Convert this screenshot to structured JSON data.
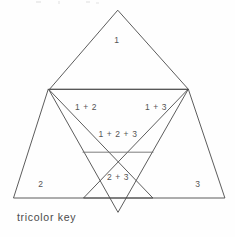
{
  "figure": {
    "caption": "tricolor key",
    "top_fragment": "",
    "regions": [
      {
        "id": "top",
        "label": "1",
        "x": 117,
        "y": 40
      },
      {
        "id": "left",
        "label": "2",
        "x": 41,
        "y": 184
      },
      {
        "id": "right",
        "label": "3",
        "x": 197,
        "y": 184
      },
      {
        "id": "one-two",
        "label": "1 + 2",
        "x": 86,
        "y": 107
      },
      {
        "id": "one-three",
        "label": "1 + 3",
        "x": 155,
        "y": 107
      },
      {
        "id": "center",
        "label": "1 + 2 + 3",
        "x": 118,
        "y": 134
      },
      {
        "id": "two-three",
        "label": "2 + 3",
        "x": 118,
        "y": 177
      }
    ],
    "colors": {
      "stroke": "#4a4a4a",
      "stroke_soft": "#6e6e6e",
      "text": "#555555",
      "background": "#fefefe"
    },
    "geometry": {
      "top_triangle": {
        "apex": [
          117,
          10
        ],
        "left": [
          49,
          89
        ],
        "right": [
          188,
          89
        ]
      },
      "left_triangle": {
        "apex": [
          48,
          89
        ],
        "left": [
          13,
          198
        ],
        "right": [
          152,
          198
        ]
      },
      "right_triangle": {
        "apex": [
          188,
          89
        ],
        "left": [
          83,
          198
        ],
        "right": [
          224,
          198
        ]
      },
      "down_triangle": {
        "left": [
          49,
          89
        ],
        "right": [
          188,
          89
        ],
        "apex": [
          118,
          212
        ]
      }
    }
  }
}
